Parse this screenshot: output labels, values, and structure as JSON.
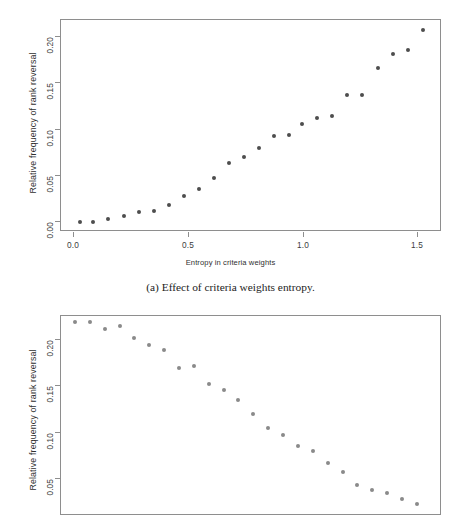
{
  "figure": {
    "caption_a": "(a) Effect of criteria weights entropy."
  },
  "chart_data": [
    {
      "id": "panel-a",
      "type": "scatter",
      "title": "",
      "xlabel": "Entropy in criteria weights",
      "ylabel": "Relative frequency of rank reversal",
      "xlim": [
        -0.02,
        1.63
      ],
      "ylim": [
        -0.004,
        0.2225
      ],
      "xticks": [
        0.0,
        0.5,
        1.0,
        1.5
      ],
      "xticklabels": [
        "0.0",
        "0.5",
        "1.0",
        "1.5"
      ],
      "yticks": [
        0.0,
        0.05,
        0.1,
        0.15,
        0.2
      ],
      "yticklabels": [
        "0.00",
        "0.05",
        "0.10",
        "0.15",
        "0.20"
      ],
      "grid": false,
      "legend": "none",
      "marker_color": "#4d4d4d",
      "x": [
        0.065,
        0.125,
        0.19,
        0.255,
        0.32,
        0.385,
        0.45,
        0.515,
        0.58,
        0.645,
        0.71,
        0.775,
        0.84,
        0.905,
        0.97,
        1.03,
        1.095,
        1.16,
        1.225,
        1.29,
        1.355,
        1.42,
        1.485,
        1.55
      ],
      "y": [
        0.0055,
        0.0058,
        0.0092,
        0.0118,
        0.0165,
        0.0172,
        0.0237,
        0.0339,
        0.0404,
        0.0528,
        0.0684,
        0.0749,
        0.0842,
        0.0972,
        0.0985,
        0.1104,
        0.1168,
        0.1192,
        0.1415,
        0.1415,
        0.1705,
        0.1855,
        0.189,
        0.211
      ]
    },
    {
      "id": "panel-b",
      "type": "scatter",
      "title": "",
      "xlabel": "",
      "ylabel": "Relative frequency of rank reversal",
      "xlim": [
        0,
        1
      ],
      "ylim": [
        0.0,
        0.2245
      ],
      "xticks": [],
      "xticklabels": [],
      "yticks": [
        0.05,
        0.1,
        0.15,
        0.2
      ],
      "yticklabels": [
        "0.05",
        "0.10",
        "0.15",
        "0.20"
      ],
      "grid": false,
      "legend": "none",
      "marker_color": "#8a8a8a",
      "x": [
        0.0385,
        0.0785,
        0.1175,
        0.1565,
        0.1955,
        0.2345,
        0.2735,
        0.3125,
        0.3515,
        0.3905,
        0.4295,
        0.4685,
        0.5075,
        0.5465,
        0.5855,
        0.6245,
        0.6635,
        0.7025,
        0.7415,
        0.7805,
        0.8195,
        0.8585,
        0.8975,
        0.9365
      ],
      "y": [
        0.217,
        0.2172,
        0.2086,
        0.2116,
        0.1985,
        0.1913,
        0.1847,
        0.165,
        0.1678,
        0.147,
        0.1402,
        0.1288,
        0.1138,
        0.098,
        0.0896,
        0.0776,
        0.0716,
        0.0582,
        0.0486,
        0.0335,
        0.0285,
        0.0242,
        0.0175,
        0.012
      ]
    }
  ]
}
